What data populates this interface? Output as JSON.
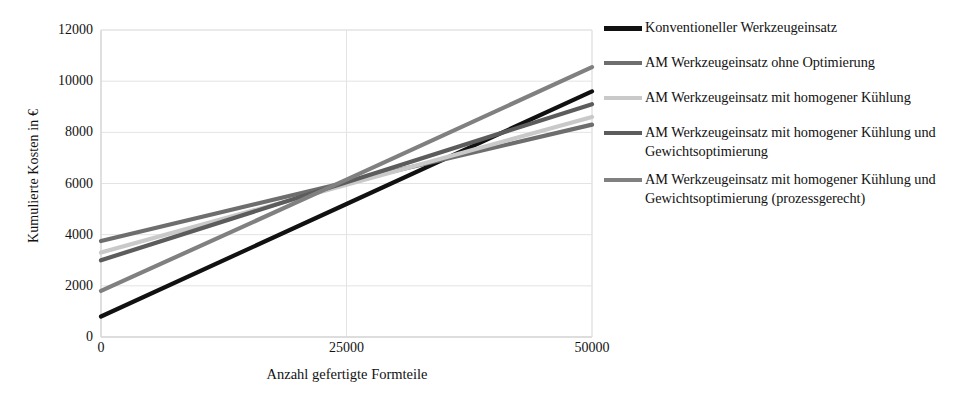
{
  "chart_data": {
    "type": "line",
    "title": "",
    "xlabel": "Anzahl gefertigte Formteile",
    "ylabel": "Kumulierte Kosten in €",
    "xlim": [
      0,
      50000
    ],
    "ylim": [
      0,
      12000
    ],
    "x": [
      0,
      25000,
      50000
    ],
    "xticks": [
      "0",
      "25000",
      "50000"
    ],
    "xtick_values": [
      0,
      25000,
      50000
    ],
    "yticks": [
      "0",
      "2000",
      "4000",
      "6000",
      "8000",
      "10000",
      "12000"
    ],
    "ytick_values": [
      0,
      2000,
      4000,
      6000,
      8000,
      10000,
      12000
    ],
    "grid": true,
    "grid_axis": "both",
    "legend_position": "right",
    "series": [
      {
        "name": "Konventioneller Werkzeugeinsatz",
        "color": "#111111",
        "width": 4.2,
        "values": [
          800,
          5200,
          9600
        ]
      },
      {
        "name": "AM Werkzeugeinsatz ohne Optimierung",
        "color": "#6e6e6e",
        "width": 4.2,
        "values": [
          3750,
          6050,
          8300
        ]
      },
      {
        "name": "AM Werkzeugeinsatz mit homogener Kühlung",
        "color": "#c9c9c9",
        "width": 4.2,
        "values": [
          3300,
          5950,
          8600
        ]
      },
      {
        "name": "AM Werkzeugeinsatz mit homogener Kühlung und Gewichtsoptimierung",
        "color": "#5c5c5c",
        "width": 4.2,
        "values": [
          3000,
          6050,
          9100
        ]
      },
      {
        "name": "AM Werkzeugeinsatz mit homogener Kühlung und Gewichtsoptimierung (prozessgerecht)",
        "color": "#808080",
        "width": 4.2,
        "values": [
          1800,
          6150,
          10550
        ]
      }
    ]
  },
  "legend": {
    "items": [
      {
        "label": "Konventioneller Werkzeugeinsatz",
        "color": "#111111",
        "thickness": "5px"
      },
      {
        "label": "AM Werkzeugeinsatz ohne Optimierung",
        "color": "#6e6e6e",
        "thickness": "4px"
      },
      {
        "label": "AM Werkzeugeinsatz mit homogener Kühlung",
        "color": "#c9c9c9",
        "thickness": "4px"
      },
      {
        "label": "AM Werkzeugeinsatz mit homogener Kühlung und Gewichtsoptimierung",
        "color": "#5c5c5c",
        "thickness": "4px"
      },
      {
        "label": "AM Werkzeugeinsatz mit homogener Kühlung und Gewichtsoptimierung (prozessgerecht)",
        "color": "#808080",
        "thickness": "4px"
      }
    ]
  },
  "style": {
    "axis_color": "#d6d6d6",
    "grid_color": "#e3e3e3",
    "text_color": "#121212",
    "background": "#ffffff"
  }
}
